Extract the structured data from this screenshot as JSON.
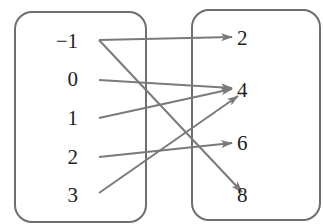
{
  "diagram": {
    "type": "mapping-diagram",
    "colors": {
      "box": "#6e6e6e",
      "arrow": "#7a7a7a",
      "text": "#222222"
    },
    "domain": {
      "label": "domain-set",
      "items": [
        {
          "text": "−1",
          "x": 78,
          "y": 48
        },
        {
          "text": "0",
          "x": 78,
          "y": 86
        },
        {
          "text": "1",
          "x": 78,
          "y": 125
        },
        {
          "text": "2",
          "x": 78,
          "y": 164
        },
        {
          "text": "3",
          "x": 78,
          "y": 202
        }
      ]
    },
    "range": {
      "label": "range-set",
      "items": [
        {
          "text": "2",
          "x": 237,
          "y": 45
        },
        {
          "text": "4",
          "x": 237,
          "y": 97
        },
        {
          "text": "6",
          "x": 237,
          "y": 150
        },
        {
          "text": "8",
          "x": 237,
          "y": 202
        }
      ]
    },
    "mappings": [
      {
        "from": "−1",
        "to": "2",
        "x1": 99,
        "y1": 40,
        "x2": 232,
        "y2": 37
      },
      {
        "from": "−1",
        "to": "8",
        "x1": 99,
        "y1": 40,
        "x2": 242,
        "y2": 192
      },
      {
        "from": "0",
        "to": "4",
        "x1": 99,
        "y1": 80,
        "x2": 232,
        "y2": 88
      },
      {
        "from": "1",
        "to": "4",
        "x1": 99,
        "y1": 118,
        "x2": 232,
        "y2": 89
      },
      {
        "from": "2",
        "to": "6",
        "x1": 99,
        "y1": 157,
        "x2": 232,
        "y2": 143
      },
      {
        "from": "3",
        "to": "4",
        "x1": 99,
        "y1": 193,
        "x2": 238,
        "y2": 96
      }
    ]
  }
}
